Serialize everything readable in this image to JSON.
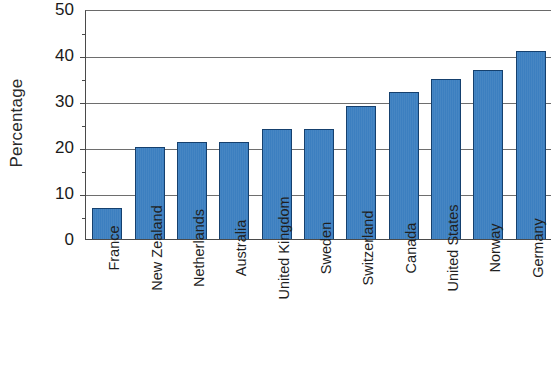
{
  "chart_data": {
    "type": "bar",
    "title": "",
    "xlabel": "",
    "ylabel": "Percentage",
    "ylim": [
      0,
      50
    ],
    "yticks": [
      0,
      10,
      20,
      30,
      40,
      50
    ],
    "ytick_labels": [
      "0",
      "10",
      "20",
      "30",
      "40",
      "50"
    ],
    "grid": true,
    "gridlines_at": [
      10,
      20,
      30,
      40
    ],
    "legend": "none",
    "xtick_label_rotation": 90,
    "bar_color": "#3c7fc0",
    "bar_edge_color": "#15406e",
    "axis_color": "#4a4a4a",
    "gridline_color": "#6e6e6e",
    "categories": [
      "France",
      "New Zealand",
      "Netherlands",
      "Australia",
      "United Kingdom",
      "Sweden",
      "Switzerland",
      "Canada",
      "United States",
      "Norway",
      "Germany"
    ],
    "values": [
      6.8,
      20.0,
      21.0,
      21.0,
      24.0,
      24.0,
      29.0,
      32.0,
      34.8,
      36.7,
      40.8
    ]
  }
}
